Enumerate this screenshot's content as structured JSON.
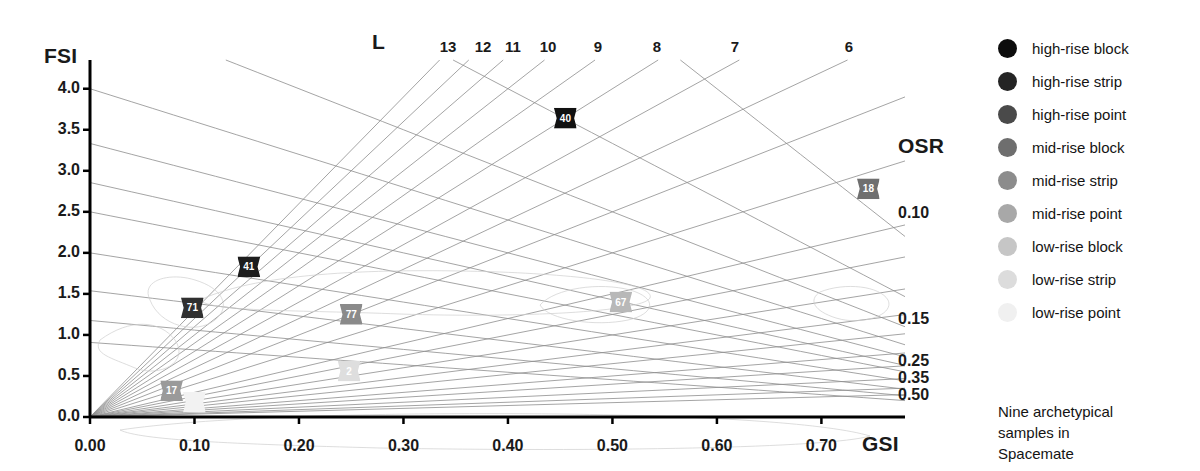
{
  "chart_data": {
    "type": "scatter",
    "title": "",
    "xlabel": "GSI",
    "ylabel": "FSI",
    "xlim": [
      0.0,
      0.78
    ],
    "ylim": [
      0.0,
      4.35
    ],
    "grid": false,
    "legend_position": "right",
    "x_ticks": [
      "0.00",
      "0.10",
      "0.20",
      "0.30",
      "0.40",
      "0.50",
      "0.60",
      "0.70"
    ],
    "x_tick_values": [
      0.0,
      0.1,
      0.2,
      0.3,
      0.4,
      0.5,
      0.6,
      0.7
    ],
    "y_ticks": [
      "0.0",
      "0.5",
      "1.0",
      "1.5",
      "2.0",
      "2.5",
      "3.0",
      "3.5",
      "4.0"
    ],
    "y_tick_values": [
      0.0,
      0.5,
      1.0,
      1.5,
      2.0,
      2.5,
      3.0,
      3.5,
      4.0
    ],
    "l_axis_label": "L",
    "l_values": [
      13,
      12,
      11,
      10,
      9,
      8,
      7,
      6
    ],
    "osr_axis_label": "OSR",
    "osr_values": [
      0.1,
      0.15,
      0.25,
      0.35,
      0.5
    ],
    "osr_labels": [
      "0.10",
      "0.15",
      "0.25",
      "0.35",
      "0.50"
    ],
    "points": [
      {
        "label": "40",
        "gsi": 0.455,
        "fsi": 3.64,
        "tone": "high-rise block",
        "color": "#111111",
        "text_color": "#ffffff"
      },
      {
        "label": "18",
        "gsi": 0.745,
        "fsi": 2.78,
        "tone": "high-rise point",
        "color": "#6f6f6f",
        "text_color": "#ffffff"
      },
      {
        "label": "41",
        "gsi": 0.152,
        "fsi": 1.83,
        "tone": "high-rise strip",
        "color": "#1d1d1d",
        "text_color": "#ffffff"
      },
      {
        "label": "71",
        "gsi": 0.098,
        "fsi": 1.33,
        "tone": "high-rise strip",
        "color": "#303030",
        "text_color": "#ffffff"
      },
      {
        "label": "77",
        "gsi": 0.25,
        "fsi": 1.25,
        "tone": "mid-rise block",
        "color": "#8a8a8a",
        "text_color": "#ffffff"
      },
      {
        "label": "67",
        "gsi": 0.508,
        "fsi": 1.4,
        "tone": "mid-rise point",
        "color": "#b8b8b8",
        "text_color": "#ffffff"
      },
      {
        "label": "2",
        "gsi": 0.248,
        "fsi": 0.56,
        "tone": "low-rise block",
        "color": "#dedede",
        "text_color": "#ffffff"
      },
      {
        "label": "17",
        "gsi": 0.078,
        "fsi": 0.32,
        "tone": "mid-rise strip",
        "color": "#9a9a9a",
        "text_color": "#ffffff"
      },
      {
        "label": "9",
        "gsi": 0.1,
        "fsi": 0.18,
        "tone": "low-rise point",
        "color": "#f2f2f2",
        "text_color": "#f2f2f2"
      }
    ]
  },
  "axes": {
    "y_title": "FSI",
    "x_title": "GSI",
    "l_title": "L",
    "osr_title": "OSR"
  },
  "legend": {
    "items": [
      {
        "label": "high-rise block",
        "color": "#0d0d0d"
      },
      {
        "label": "high-rise strip",
        "color": "#242424"
      },
      {
        "label": "high-rise point",
        "color": "#4a4a4a"
      },
      {
        "label": "mid-rise block",
        "color": "#6e6e6e"
      },
      {
        "label": "mid-rise strip",
        "color": "#8c8c8c"
      },
      {
        "label": "mid-rise point",
        "color": "#a8a8a8"
      },
      {
        "label": "low-rise block",
        "color": "#c6c6c6"
      },
      {
        "label": "low-rise strip",
        "color": "#dcdcdc"
      },
      {
        "label": "low-rise point",
        "color": "#f0f0f0"
      }
    ]
  },
  "caption": {
    "line1": "Nine archetypical",
    "line2": "samples in",
    "line3": "Spacemate"
  }
}
